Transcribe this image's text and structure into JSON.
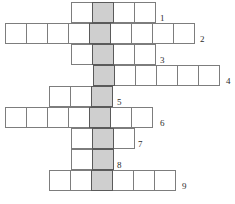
{
  "puzzle": {
    "type": "crossword-grid",
    "title": "Crossword puzzle grid",
    "width": 235,
    "height": 204,
    "cell_width": 22,
    "cell_height": 21,
    "colors": {
      "cell_fill": "#ffffff",
      "cell_border": "#7d7d7d",
      "highlight_fill": "#cfcfcf",
      "highlight_border": "#5a5a5a",
      "number_color": "#2b2b2b",
      "background": "#ffffff"
    },
    "highlight_column_index": 1,
    "rows": [
      {
        "number": "1",
        "start_x": 71,
        "start_y": 2,
        "cells": 4,
        "highlight_cell": 1,
        "label_x": 160,
        "label_y": 14
      },
      {
        "number": "2",
        "start_x": 5,
        "start_y": 23,
        "cells": 9,
        "highlight_cell": 4,
        "label_x": 200,
        "label_y": 35
      },
      {
        "number": "3",
        "start_x": 71,
        "start_y": 44,
        "cells": 4,
        "highlight_cell": 1,
        "label_x": 160,
        "label_y": 56
      },
      {
        "number": "4",
        "start_x": 93,
        "start_y": 65,
        "cells": 6,
        "highlight_cell": 0,
        "label_x": 226,
        "label_y": 77
      },
      {
        "number": "5",
        "start_x": 49,
        "start_y": 86,
        "cells": 3,
        "highlight_cell": 2,
        "label_x": 117,
        "label_y": 98
      },
      {
        "number": "6",
        "start_x": 5,
        "start_y": 107,
        "cells": 7,
        "highlight_cell": 4,
        "label_x": 160,
        "label_y": 119
      },
      {
        "number": "7",
        "start_x": 71,
        "start_y": 128,
        "cells": 3,
        "highlight_cell": 1,
        "label_x": 138,
        "label_y": 140
      },
      {
        "number": "8",
        "start_x": 71,
        "start_y": 149,
        "cells": 2,
        "highlight_cell": 1,
        "label_x": 117,
        "label_y": 161
      },
      {
        "number": "9",
        "start_x": 49,
        "start_y": 170,
        "cells": 6,
        "highlight_cell": 2,
        "label_x": 182,
        "label_y": 182
      }
    ]
  }
}
